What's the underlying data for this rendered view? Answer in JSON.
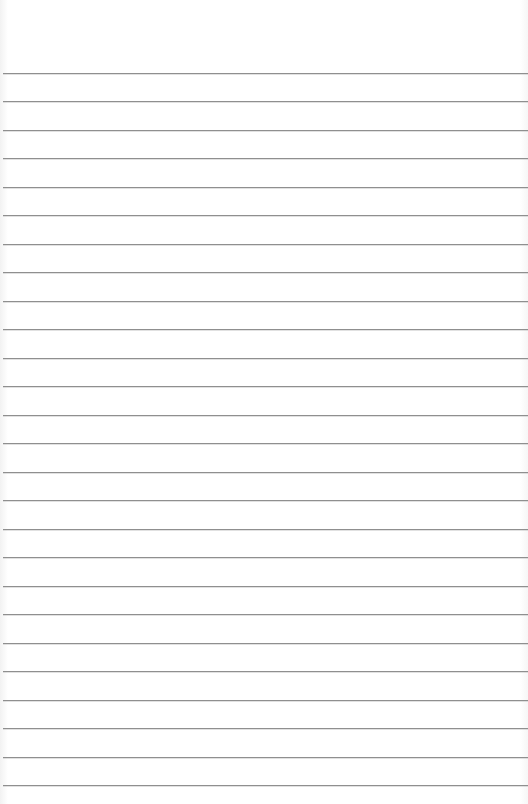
{
  "paper": {
    "type": "lined-paper",
    "background_color": "#ffffff",
    "line_color": "#8f8f8f",
    "first_line_y": 73,
    "line_spacing": 28.48,
    "line_count": 26
  }
}
